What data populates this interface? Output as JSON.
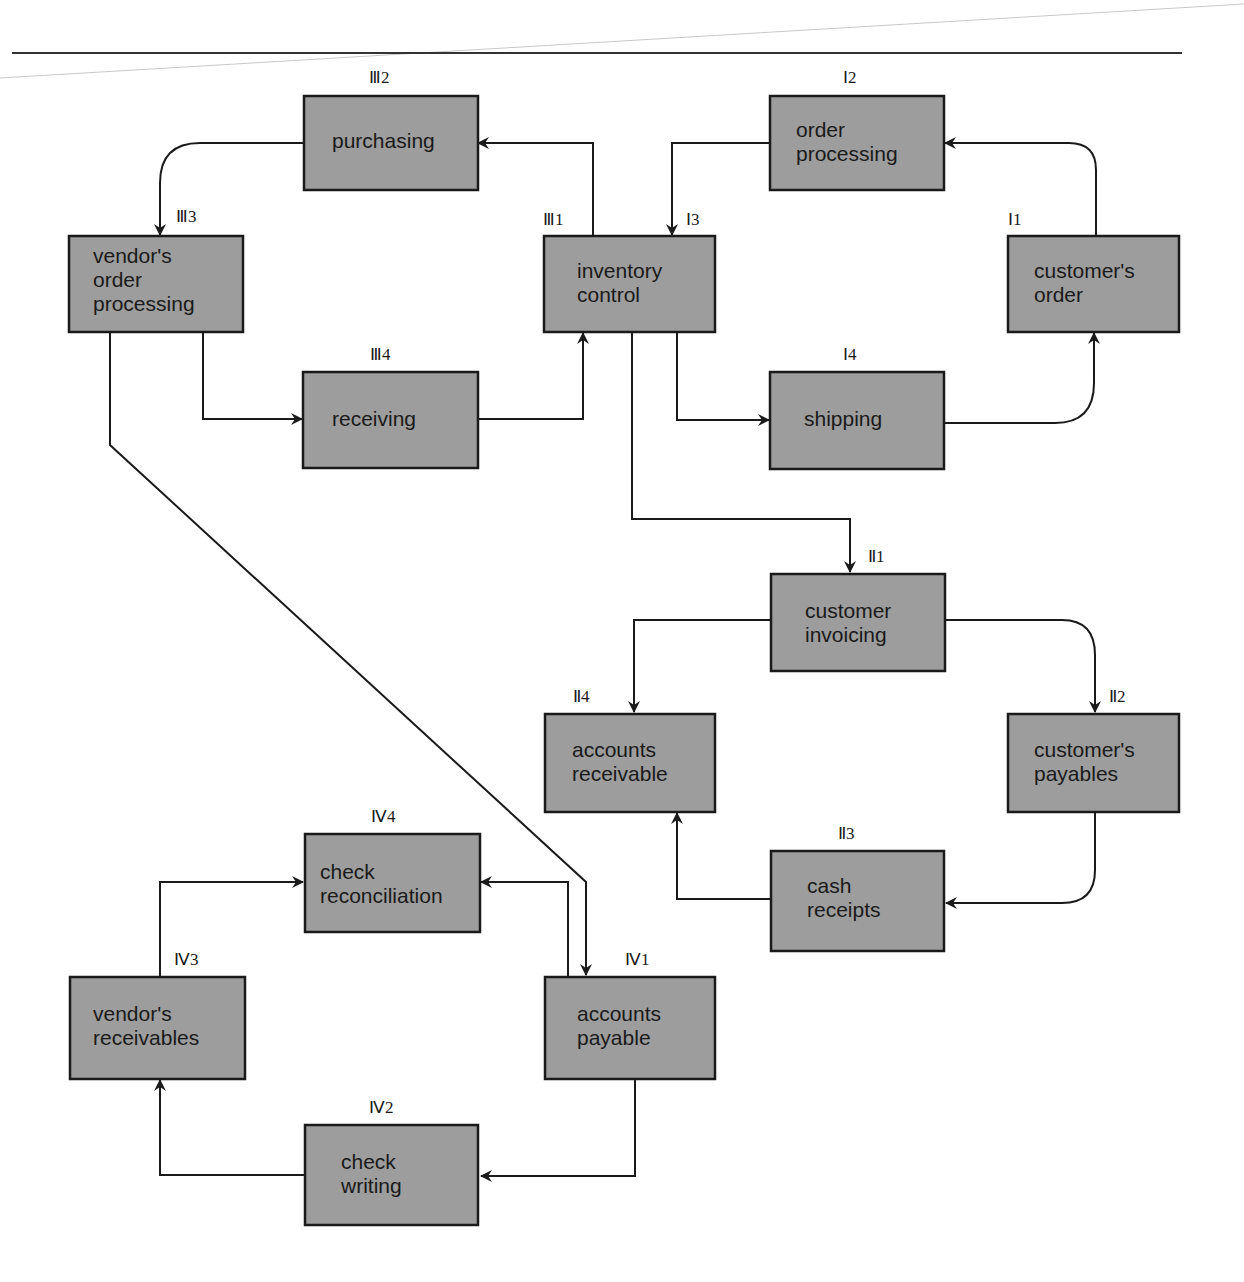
{
  "diagram": {
    "title": "",
    "colors": {
      "box_fill": "#9d9d9d",
      "line": "#1a1a1a",
      "background": "#ffffff"
    },
    "cycles": [
      {
        "id": "I",
        "name": "order fulfillment cycle"
      },
      {
        "id": "II",
        "name": "customer billing cycle"
      },
      {
        "id": "III",
        "name": "vendor purchasing cycle"
      },
      {
        "id": "IV",
        "name": "vendor payment cycle"
      }
    ],
    "nodes": {
      "III2": {
        "label": "Ⅲ2",
        "lines": [
          "purchasing"
        ]
      },
      "III3": {
        "label": "Ⅲ3",
        "lines": [
          "vendor's",
          "order",
          "processing"
        ]
      },
      "III1": {
        "label": "Ⅲ1",
        "lines": [
          "inventory",
          "control"
        ]
      },
      "I3": {
        "label": "Ⅰ3"
      },
      "I2": {
        "label": "Ⅰ2",
        "lines": [
          "order",
          "processing"
        ]
      },
      "I1": {
        "label": "Ⅰ1",
        "lines": [
          "customer's",
          "order"
        ]
      },
      "III4": {
        "label": "Ⅲ4",
        "lines": [
          "receiving"
        ]
      },
      "I4": {
        "label": "Ⅰ4",
        "lines": [
          "shipping"
        ]
      },
      "II1": {
        "label": "Ⅱ1",
        "lines": [
          "customer",
          "invoicing"
        ]
      },
      "II4": {
        "label": "Ⅱ4",
        "lines": [
          "accounts",
          "receivable"
        ]
      },
      "II2": {
        "label": "Ⅱ2",
        "lines": [
          "customer's",
          "payables"
        ]
      },
      "II3": {
        "label": "Ⅱ3",
        "lines": [
          "cash",
          "receipts"
        ]
      },
      "IV4": {
        "label": "Ⅳ4",
        "lines": [
          "check",
          "reconciliation"
        ]
      },
      "IV3": {
        "label": "Ⅳ3",
        "lines": [
          "vendor's",
          "receivables"
        ]
      },
      "IV1": {
        "label": "Ⅳ1",
        "lines": [
          "accounts",
          "payable"
        ]
      },
      "IV2": {
        "label": "Ⅳ2",
        "lines": [
          "check",
          "writing"
        ]
      }
    },
    "edges": [
      {
        "from": "customer's order",
        "to": "order processing"
      },
      {
        "from": "order processing",
        "to": "inventory control"
      },
      {
        "from": "inventory control",
        "to": "shipping"
      },
      {
        "from": "shipping",
        "to": "customer's order"
      },
      {
        "from": "inventory control",
        "to": "purchasing"
      },
      {
        "from": "purchasing",
        "to": "vendor's order processing"
      },
      {
        "from": "vendor's order processing",
        "to": "receiving"
      },
      {
        "from": "receiving",
        "to": "inventory control"
      },
      {
        "from": "inventory control",
        "to": "customer invoicing"
      },
      {
        "from": "customer invoicing",
        "to": "accounts receivable"
      },
      {
        "from": "customer invoicing",
        "to": "customer's payables"
      },
      {
        "from": "customer's payables",
        "to": "cash receipts"
      },
      {
        "from": "cash receipts",
        "to": "accounts receivable"
      },
      {
        "from": "vendor's order processing",
        "to": "accounts payable"
      },
      {
        "from": "accounts payable",
        "to": "check reconciliation"
      },
      {
        "from": "accounts payable",
        "to": "check writing"
      },
      {
        "from": "check writing",
        "to": "vendor's receivables"
      },
      {
        "from": "vendor's receivables",
        "to": "check reconciliation"
      }
    ]
  }
}
